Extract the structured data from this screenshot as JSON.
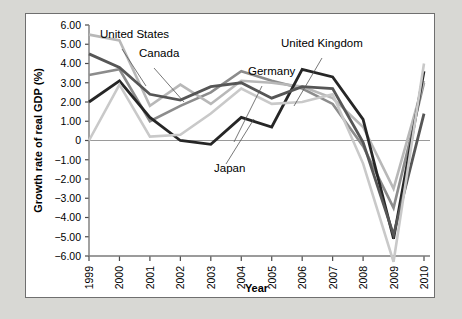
{
  "figure": {
    "background": "#d8d8d4",
    "panel_background": "#ffffff",
    "border_color": "#6f6f6f"
  },
  "axes": {
    "ylabel": "Growth rate of real GDP (%)",
    "xlabel": "Year",
    "yticks": [
      "6.00",
      "5.00",
      "4.00",
      "3.00",
      "2.00",
      "1.00",
      "0",
      "-1.00",
      "-2.00",
      "-3.00",
      "-4.00",
      "-5.00",
      "-6.00"
    ],
    "xticks": [
      "1999",
      "2000",
      "2001",
      "2002",
      "2003",
      "2004",
      "2005",
      "2006",
      "2007",
      "2008",
      "2009",
      "2010"
    ]
  },
  "annotations": [
    {
      "name": "united-states",
      "text": "United States",
      "x": 74,
      "y": 24
    },
    {
      "name": "canada",
      "text": "Canada",
      "x": 113,
      "y": 43
    },
    {
      "name": "germany",
      "text": "Germany",
      "x": 222,
      "y": 61
    },
    {
      "name": "united-kingdom",
      "text": "United Kingdom",
      "x": 255,
      "y": 33
    },
    {
      "name": "japan",
      "text": "Japan",
      "x": 188,
      "y": 158
    }
  ],
  "chart_data": {
    "type": "line",
    "title": "",
    "xlabel": "Year",
    "ylabel": "Growth rate of real GDP (%)",
    "x": [
      1999,
      2000,
      2001,
      2002,
      2003,
      2004,
      2005,
      2006,
      2007,
      2008,
      2009,
      2010
    ],
    "xlim": [
      1999,
      2010
    ],
    "ylim": [
      -6.0,
      6.0
    ],
    "grid": false,
    "legend": "inline-labels",
    "series": [
      {
        "name": "United States",
        "color": "#8c8c8c",
        "width": 2.6,
        "values": [
          3.4,
          3.7,
          1.0,
          1.8,
          2.5,
          3.6,
          3.1,
          2.7,
          1.9,
          -0.3,
          -3.5,
          3.0
        ]
      },
      {
        "name": "Canada",
        "color": "#b8b8b8",
        "width": 2.6,
        "values": [
          5.5,
          5.2,
          1.8,
          2.9,
          1.9,
          3.1,
          3.0,
          2.8,
          2.2,
          0.7,
          -2.5,
          3.1
        ]
      },
      {
        "name": "Germany",
        "color": "#262626",
        "width": 2.8,
        "values": [
          2.0,
          3.1,
          1.2,
          0.0,
          -0.2,
          1.2,
          0.7,
          3.7,
          3.3,
          1.1,
          -5.1,
          3.6
        ]
      },
      {
        "name": "United Kingdom",
        "color": "#565656",
        "width": 2.8,
        "values": [
          4.5,
          3.8,
          2.4,
          2.1,
          2.8,
          3.0,
          2.2,
          2.8,
          2.7,
          -0.1,
          -4.9,
          1.4
        ]
      },
      {
        "name": "Japan",
        "color": "#c9c9c9",
        "width": 2.6,
        "values": [
          0.0,
          2.9,
          0.2,
          0.3,
          1.4,
          2.7,
          1.9,
          2.0,
          2.4,
          -1.2,
          -6.3,
          4.0
        ]
      }
    ]
  }
}
